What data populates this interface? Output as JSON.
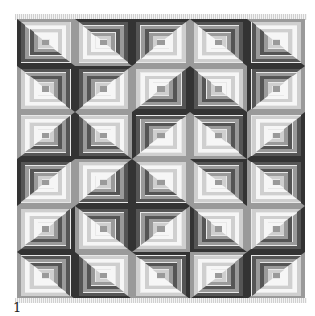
{
  "figure": {
    "label": "1",
    "grid": {
      "columns": 5,
      "rows": 6
    },
    "tones": {
      "w": "#f6f6f6",
      "l": "#cfcfcf",
      "m": "#9a9a9a",
      "d": "#555555",
      "k": "#333333"
    },
    "cells": [
      [
        "DR",
        "LB",
        "TL",
        "LB",
        "DR"
      ],
      [
        "TR",
        "TL",
        "BR",
        "BL",
        "TL"
      ],
      [
        "LT",
        "BL",
        "TL",
        "TR",
        "LT"
      ],
      [
        "TL",
        "BR",
        "BL",
        "LB",
        "TR"
      ],
      [
        "BR",
        "TR",
        "TL",
        "BL",
        "LT"
      ],
      [
        "TR",
        "BL",
        "LB",
        "BR",
        "TL"
      ]
    ]
  }
}
